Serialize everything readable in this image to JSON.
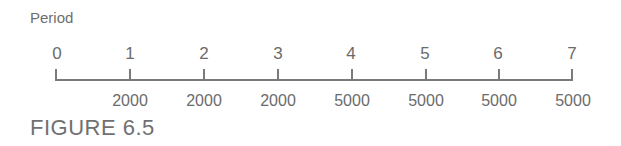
{
  "title": "Period",
  "caption": "FIGURE 6.5",
  "timeline": {
    "periods": [
      "0",
      "1",
      "2",
      "3",
      "4",
      "5",
      "6",
      "7"
    ],
    "values": [
      "",
      "2000",
      "2000",
      "2000",
      "5000",
      "5000",
      "5000",
      "5000"
    ]
  },
  "colors": {
    "line": "#7a7a7a",
    "text": "#6b6b6b"
  }
}
